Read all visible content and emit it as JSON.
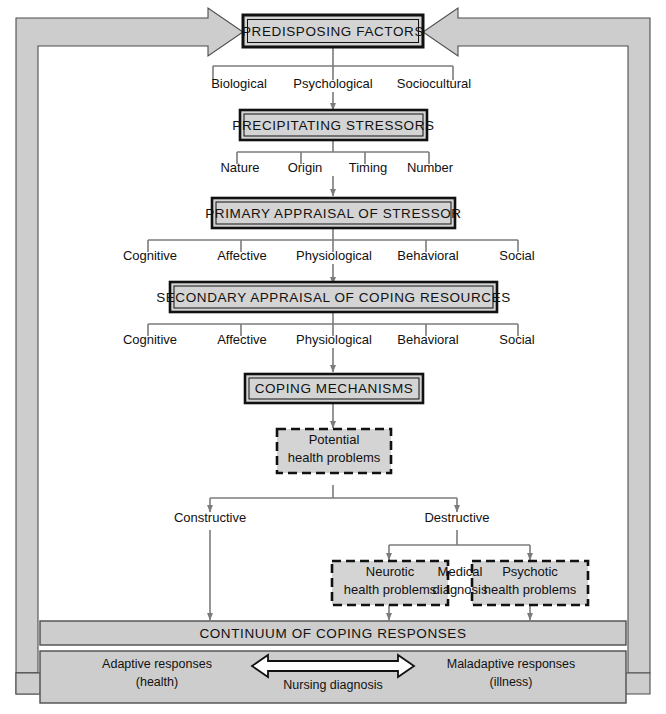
{
  "figure": {
    "colors": {
      "band_fill": "#cdcdcd",
      "box_fill": "#d4d4d4",
      "line": "#7b7b7b",
      "stroke": "#1a1a1a",
      "text": "#111111",
      "background": "#ffffff"
    }
  },
  "nodes": {
    "predisposing_factors": "PREDISPOSING FACTORS",
    "precipitating_stressors": "PRECIPITATING STRESSORS",
    "primary_appraisal": "PRIMARY APPRAISAL OF STRESSOR",
    "secondary_appraisal": "SECONDARY APPRAISAL OF COPING RESOURCES",
    "coping_mechanisms": "COPING MECHANISMS",
    "potential_health_problems": [
      "Potential",
      "health problems"
    ],
    "neurotic_health_problems": [
      "Neurotic",
      "health problems"
    ],
    "psychotic_health_problems": [
      "Psychotic",
      "health problems"
    ],
    "medical_diagnosis": [
      "Medical",
      "diagnosis"
    ],
    "continuum": "CONTINUUM OF COPING RESPONSES"
  },
  "branches": {
    "predisposing": [
      "Biological",
      "Psychological",
      "Sociocultural"
    ],
    "stressors": [
      "Nature",
      "Origin",
      "Timing",
      "Number"
    ],
    "primary_appraisal": [
      "Cognitive",
      "Affective",
      "Physiological",
      "Behavioral",
      "Social"
    ],
    "secondary_appraisal": [
      "Cognitive",
      "Affective",
      "Physiological",
      "Behavioral",
      "Social"
    ],
    "coping_outcome": [
      "Constructive",
      "Destructive"
    ]
  },
  "footer": {
    "left_line1": "Adaptive responses",
    "left_line2": "(health)",
    "center": "Nursing diagnosis",
    "right_line1": "Maladaptive responses",
    "right_line2": "(illness)"
  }
}
